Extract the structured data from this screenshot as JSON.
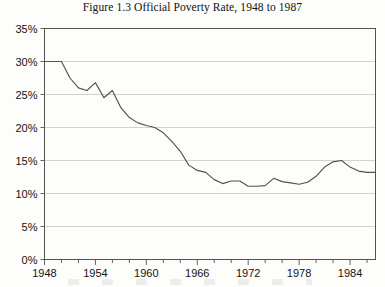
{
  "figure": {
    "title": "Figure 1.3   Official Poverty Rate, 1948 to 1987",
    "line_color": "#55524c",
    "grid_color": "#c9c7c2",
    "axis_color": "#55524c",
    "background": "#fdfdfc"
  },
  "chart_data": {
    "type": "line",
    "title": "Figure 1.3   Official Poverty Rate, 1948 to 1987",
    "xlabel": "",
    "ylabel": "",
    "xlim": [
      1948,
      1987
    ],
    "ylim": [
      0,
      35
    ],
    "grid": true,
    "legend": "none",
    "y_tick_labels": [
      "0%",
      "5%",
      "10%",
      "15%",
      "20%",
      "25%",
      "30%",
      "35%"
    ],
    "y_tick_values": [
      0,
      5,
      10,
      15,
      20,
      25,
      30,
      35
    ],
    "x_tick_labels": [
      "1948",
      "1954",
      "1960",
      "1966",
      "1972",
      "1978",
      "1984"
    ],
    "x_tick_values": [
      1948,
      1954,
      1960,
      1966,
      1972,
      1978,
      1984
    ],
    "x_minor_step": 2,
    "x": [
      1948,
      1949,
      1950,
      1951,
      1952,
      1953,
      1954,
      1955,
      1956,
      1957,
      1958,
      1959,
      1960,
      1961,
      1962,
      1963,
      1964,
      1965,
      1966,
      1967,
      1968,
      1969,
      1970,
      1971,
      1972,
      1973,
      1974,
      1975,
      1976,
      1977,
      1978,
      1979,
      1980,
      1981,
      1982,
      1983,
      1984,
      1985,
      1986,
      1987
    ],
    "values": [
      30.0,
      30.0,
      30.0,
      27.5,
      26.0,
      25.6,
      26.8,
      24.5,
      25.6,
      23.0,
      21.5,
      20.7,
      20.3,
      20.0,
      19.2,
      17.9,
      16.4,
      14.3,
      13.5,
      13.2,
      12.1,
      11.5,
      11.9,
      11.9,
      11.1,
      11.1,
      11.2,
      12.3,
      11.8,
      11.6,
      11.4,
      11.7,
      12.6,
      14.0,
      14.8,
      15.0,
      14.0,
      13.4,
      13.2,
      13.2
    ],
    "series": [
      {
        "name": "Official Poverty Rate",
        "values": [
          30.0,
          30.0,
          30.0,
          27.5,
          26.0,
          25.6,
          26.8,
          24.5,
          25.6,
          23.0,
          21.5,
          20.7,
          20.3,
          20.0,
          19.2,
          17.9,
          16.4,
          14.3,
          13.5,
          13.2,
          12.1,
          11.5,
          11.9,
          11.9,
          11.1,
          11.1,
          11.2,
          12.3,
          11.8,
          11.6,
          11.4,
          11.7,
          12.6,
          14.0,
          14.8,
          15.0,
          14.0,
          13.4,
          13.2,
          13.2
        ]
      }
    ]
  }
}
